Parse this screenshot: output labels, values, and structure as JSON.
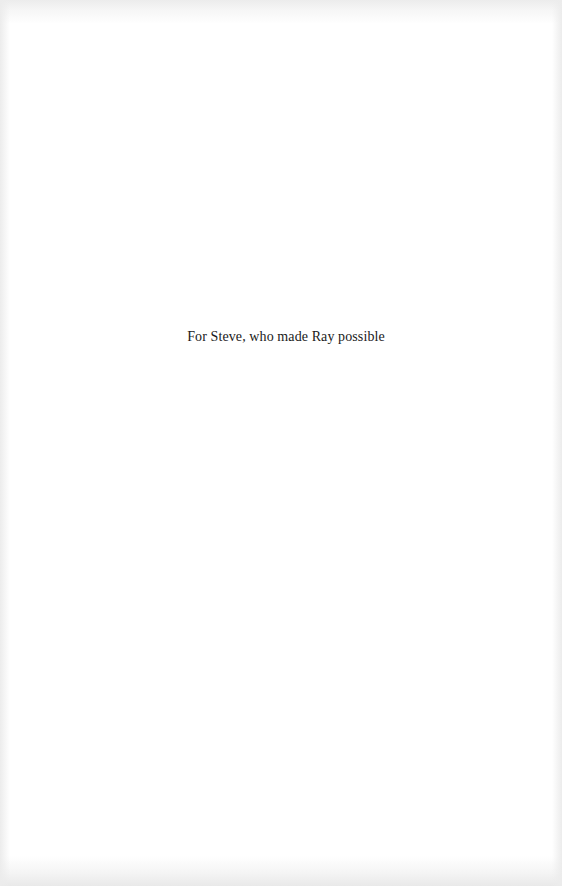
{
  "page": {
    "dedication": "For Steve, who made Ray possible"
  }
}
